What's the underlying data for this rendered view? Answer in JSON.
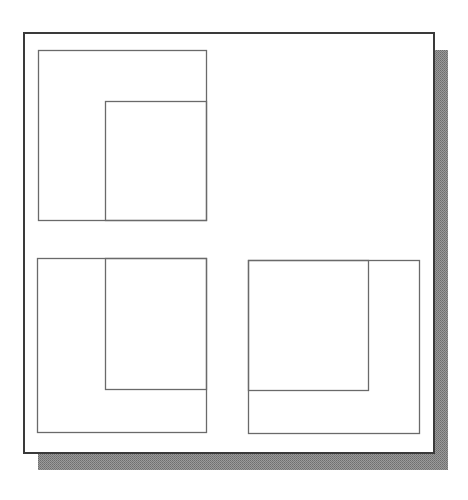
{
  "figure": {
    "type": "nested-square-diagram",
    "colors": {
      "background": "#ffffff",
      "frame_stroke": "#3a3a3a",
      "box_stroke": "#6a6a6a",
      "shadow": "#8c8c8c"
    },
    "frame": {
      "x": 24,
      "y": 33,
      "width": 410,
      "height": 420
    },
    "shadow": {
      "offset_x": 14,
      "offset_y": 17
    },
    "panels": [
      {
        "id": "top-left",
        "outer": {
          "x": 38,
          "y": 50,
          "width": 168,
          "height": 170
        },
        "inner": {
          "x": 105,
          "y": 101,
          "width": 101,
          "height": 119
        },
        "inner_anchor": "bottom-right"
      },
      {
        "id": "bottom-left",
        "outer": {
          "x": 37,
          "y": 258,
          "width": 169,
          "height": 174
        },
        "inner": {
          "x": 105,
          "y": 258,
          "width": 101,
          "height": 131
        },
        "inner_anchor": "top-right"
      },
      {
        "id": "bottom-right",
        "outer": {
          "x": 248,
          "y": 260,
          "width": 171,
          "height": 173
        },
        "inner": {
          "x": 248,
          "y": 260,
          "width": 120,
          "height": 130
        },
        "inner_anchor": "top-left"
      }
    ]
  }
}
